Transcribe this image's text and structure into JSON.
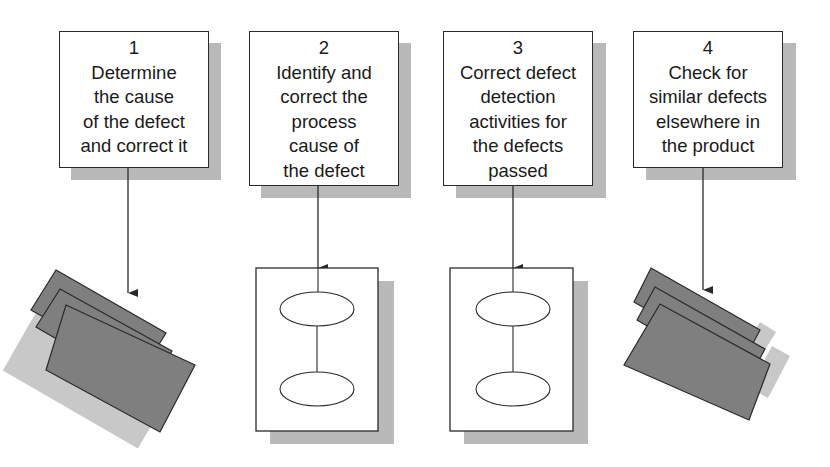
{
  "diagram": {
    "steps": [
      {
        "number": "1",
        "text": "Determine\nthe cause\nof the defect\nand correct it",
        "output": "product-documents"
      },
      {
        "number": "2",
        "text": "Identify and\ncorrect the\nprocess\ncause of\nthe defect",
        "output": "process-diagram"
      },
      {
        "number": "3",
        "text": "Correct defect\ndetection\nactivities for\nthe defects\npassed",
        "output": "process-diagram"
      },
      {
        "number": "4",
        "text": "Check for\nsimilar defects\nelsewhere in\nthe product",
        "output": "product-documents"
      }
    ],
    "colors": {
      "line": "#2a2a2a",
      "shadow": "#b9b9b9",
      "document_fill": "#7f7f7f",
      "background": "#ffffff"
    }
  }
}
